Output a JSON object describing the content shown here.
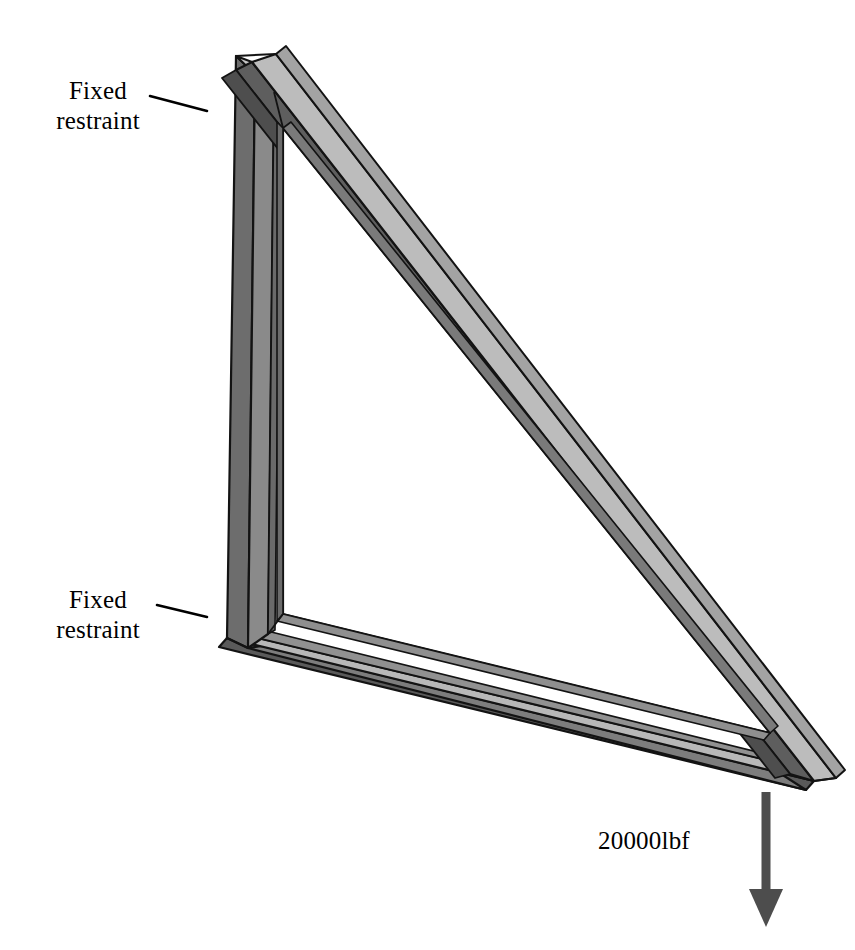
{
  "figure": {
    "type": "engineering-fea-diagram",
    "background_color": "#ffffff"
  },
  "annotations": {
    "fixed_restraint_top": {
      "text": "Fixed\nrestraint",
      "name": "fixed-restraint-top"
    },
    "fixed_restraint_bottom": {
      "text": "Fixed\nrestraint",
      "name": "fixed-restraint-bottom"
    },
    "load": {
      "text": "20000lbf",
      "magnitude": 20000,
      "unit": "lbf",
      "direction": "down",
      "name": "applied-load"
    }
  },
  "leader_lines": [
    {
      "name": "leader-line-top",
      "x1": 150,
      "y1": 96,
      "x2": 207,
      "y2": 111
    },
    {
      "name": "leader-line-bottom",
      "x1": 157,
      "y1": 605,
      "x2": 207,
      "y2": 617
    }
  ],
  "load_arrow": {
    "name": "load-arrow",
    "color": "#4d4d4d",
    "shaft_x": 766,
    "shaft_top": 792,
    "shaft_bottom": 890,
    "shaft_width": 9,
    "head_width": 34,
    "head_tip_y": 927
  },
  "colors": {
    "face_top_light": "#b4b4b4",
    "face_top_lighter": "#c3c3c3",
    "face_side_mid": "#9a9a9a",
    "face_side_dark": "#6f6f6f",
    "face_inner_dark": "#5e5e5e",
    "face_shadow": "#4a4a4a",
    "edge": "#1a1a1a",
    "arrow": "#4d4d4d",
    "text": "#000000"
  },
  "geometry": {
    "apex_top": {
      "x": 236,
      "y": 56
    },
    "corner_bottom_left": {
      "x": 227,
      "y": 638
    },
    "corner_bottom_right": {
      "x": 814,
      "y": 781
    },
    "members": [
      "vertical-left-member",
      "hypotenuse-member",
      "bottom-chord-member"
    ]
  }
}
